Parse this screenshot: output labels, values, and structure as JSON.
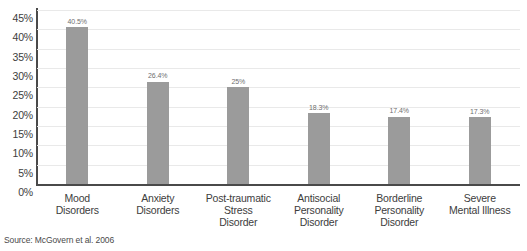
{
  "chart_data": {
    "type": "bar",
    "title": "",
    "subtitle": "",
    "xlabel": "",
    "ylabel": "",
    "ylim": [
      0,
      45
    ],
    "grid": true,
    "legend": "none",
    "orientation": "vertical",
    "bar_color": "#9b9b9b",
    "gridline_color": "#e9e9e9",
    "axis_color": "#4a4a4a",
    "categories": [
      "Mood\nDisorders",
      "Anxiety\nDisorders",
      "Post-traumatic\nStress\nDisorder",
      "Antisocial\nPersonality\nDisorder",
      "Borderline\nPersonality\nDisorder",
      "Severe\nMental Illness"
    ],
    "values": [
      40.5,
      26.4,
      25,
      18.3,
      17.4,
      17.3
    ],
    "value_labels": [
      "40.5%",
      "26.4%",
      "25%",
      "18.3%",
      "17.4%",
      "17.3%"
    ],
    "y_ticks": [
      0,
      5,
      10,
      15,
      20,
      25,
      30,
      35,
      40,
      45
    ],
    "y_tick_labels": [
      "0%",
      "5%",
      "10%",
      "15%",
      "20%",
      "25%",
      "30%",
      "35%",
      "40%",
      "45%"
    ],
    "source": "Source: McGovern et al. 2006"
  },
  "categories_display": [
    {
      "lines": [
        "Mood",
        "Disorders"
      ]
    },
    {
      "lines": [
        "Anxiety",
        "Disorders"
      ]
    },
    {
      "lines": [
        "Post-traumatic",
        "Stress",
        "Disorder"
      ]
    },
    {
      "lines": [
        "Antisocial",
        "Personality",
        "Disorder"
      ]
    },
    {
      "lines": [
        "Borderline",
        "Personality",
        "Disorder"
      ]
    },
    {
      "lines": [
        "Severe",
        "Mental Illness"
      ]
    }
  ],
  "footer": {
    "source": "Source: McGovern et al. 2006"
  }
}
